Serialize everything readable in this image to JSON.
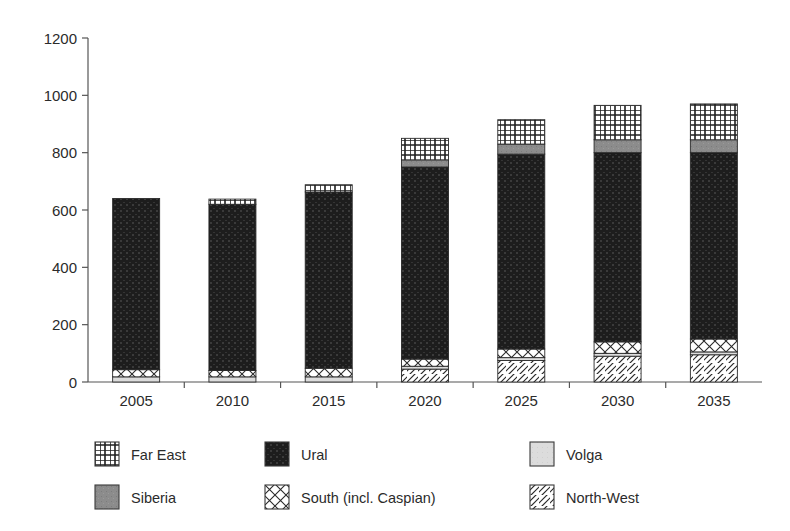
{
  "chart_data": {
    "type": "bar",
    "subtype": "stacked-bar",
    "title": "",
    "xlabel": "",
    "ylabel": "",
    "ylim": [
      0,
      1200
    ],
    "ytick_step": 200,
    "yticks": [
      "0",
      "200",
      "400",
      "600",
      "800",
      "1000",
      "1200"
    ],
    "grid": false,
    "legend_position": "bottom",
    "categories": [
      "2005",
      "2010",
      "2015",
      "2020",
      "2025",
      "2030",
      "2035"
    ],
    "series": [
      {
        "name": "North-West",
        "pattern": "diagonal-hatch",
        "color": "#ffffff",
        "values": [
          0,
          0,
          0,
          45,
          75,
          90,
          95
        ]
      },
      {
        "name": "Volga",
        "pattern": "solid-light",
        "color": "#dcdcdc",
        "values": [
          18,
          18,
          18,
          10,
          10,
          10,
          10
        ]
      },
      {
        "name": "South (incl. Caspian)",
        "pattern": "cross-hatch",
        "color": "#ffffff",
        "values": [
          25,
          22,
          30,
          25,
          30,
          40,
          45
        ]
      },
      {
        "name": "Ural",
        "pattern": "solid-dark",
        "color": "#1d1d1d",
        "values": [
          597,
          580,
          615,
          670,
          680,
          660,
          650
        ]
      },
      {
        "name": "Siberia",
        "pattern": "solid-mid",
        "color": "#8c8c8c",
        "values": [
          0,
          0,
          0,
          25,
          35,
          45,
          45
        ]
      },
      {
        "name": "Far East",
        "pattern": "grid-hatch",
        "color": "#ffffff",
        "values": [
          0,
          18,
          25,
          75,
          85,
          120,
          125
        ]
      }
    ],
    "totals": [
      640,
      638,
      688,
      850,
      915,
      965,
      970
    ]
  },
  "legend": {
    "entries": [
      {
        "label": "Far East",
        "pattern": "grid-hatch"
      },
      {
        "label": "Ural",
        "pattern": "solid-dark"
      },
      {
        "label": "Volga",
        "pattern": "solid-light"
      },
      {
        "label": "Siberia",
        "pattern": "solid-mid"
      },
      {
        "label": "South (incl. Caspian)",
        "pattern": "cross-hatch"
      },
      {
        "label": "North-West",
        "pattern": "diagonal-hatch"
      }
    ]
  },
  "colors": {
    "ural": "#1d1d1d",
    "siberia": "#8c8c8c",
    "volga": "#dcdcdc",
    "axis": "#555555",
    "text": "#2b2b2b",
    "background": "#ffffff"
  }
}
